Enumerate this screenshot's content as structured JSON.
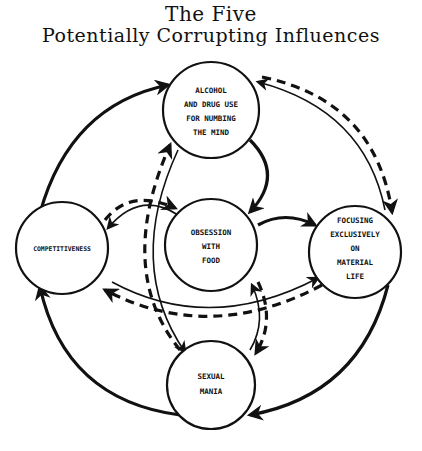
{
  "title": {
    "line1": "The Five",
    "line2": "Potentially Corrupting Influences"
  },
  "nodes": {
    "alcohol": {
      "lines": [
        "ALCOHOL",
        "AND DRUG USE",
        "FOR NUMBING",
        "THE MIND"
      ]
    },
    "food": {
      "lines": [
        "OBSESSION",
        "WITH",
        "FOOD"
      ]
    },
    "material": {
      "lines": [
        "FOCUSING",
        "EXCLUSIVELY",
        "ON",
        "MATERIAL",
        "LIFE"
      ]
    },
    "competitiveness": {
      "lines": [
        "COMPETITIVENESS"
      ]
    },
    "sexual": {
      "lines": [
        "SEXUAL",
        "MANIA"
      ]
    }
  },
  "edges": [
    {
      "from": "competitiveness",
      "to": "alcohol",
      "style": "solid-thick"
    },
    {
      "from": "alcohol",
      "to": "food",
      "style": "solid-thick"
    },
    {
      "from": "food",
      "to": "material",
      "style": "solid-thick"
    },
    {
      "from": "material",
      "to": "sexual",
      "style": "solid-thick"
    },
    {
      "from": "sexual",
      "to": "competitiveness",
      "style": "solid-thick"
    },
    {
      "from": "material",
      "to": "alcohol",
      "style": "solid-thin"
    },
    {
      "from": "alcohol",
      "to": "material",
      "style": "dashed"
    },
    {
      "from": "competitiveness",
      "to": "food",
      "style": "dashed"
    },
    {
      "from": "food",
      "to": "competitiveness",
      "style": "solid-thin"
    },
    {
      "from": "sexual",
      "to": "alcohol",
      "style": "dashed"
    },
    {
      "from": "alcohol",
      "to": "sexual",
      "style": "solid-thin"
    },
    {
      "from": "competitiveness",
      "to": "material",
      "style": "solid-thin"
    },
    {
      "from": "material",
      "to": "competitiveness",
      "style": "dashed"
    },
    {
      "from": "sexual",
      "to": "food",
      "style": "solid-thin"
    },
    {
      "from": "food",
      "to": "sexual",
      "style": "dashed"
    }
  ]
}
